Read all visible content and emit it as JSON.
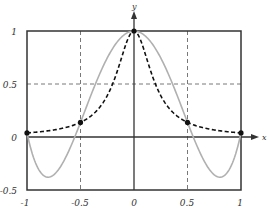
{
  "chart_data": {
    "type": "line",
    "title": "",
    "xlabel": "x",
    "ylabel": "y",
    "xlim": [
      -1,
      1
    ],
    "ylim": [
      -0.5,
      1
    ],
    "grid": true,
    "legend": null,
    "xticks": [
      "-1",
      "-0.5",
      "0",
      "0.5",
      "1"
    ],
    "yticks": [
      "-0.5",
      "0",
      "0.5",
      "1"
    ],
    "series": [
      {
        "name": "f(x) = 1/(1+25x^2)",
        "style": "dashed",
        "color": "#111111",
        "x": [
          -1,
          -0.75,
          -0.5,
          -0.25,
          0,
          0.25,
          0.5,
          0.75,
          1
        ],
        "y": [
          0.038,
          0.066,
          0.138,
          0.39,
          1,
          0.39,
          0.138,
          0.066,
          0.038
        ]
      },
      {
        "name": "interpolating polynomial (degree 4)",
        "style": "solid",
        "color": "#aaaaaa",
        "x": [
          -1,
          -0.8,
          -0.75,
          -0.5,
          -0.25,
          0,
          0.25,
          0.5,
          0.75,
          0.8,
          1
        ],
        "y": [
          0.038,
          -0.36,
          -0.35,
          0.138,
          0.73,
          1,
          0.73,
          0.138,
          -0.35,
          -0.36,
          0.038
        ]
      }
    ],
    "markers": {
      "name": "interpolation nodes",
      "x": [
        -1,
        -0.5,
        0,
        0.5,
        1
      ],
      "y": [
        0.038,
        0.138,
        1,
        0.138,
        0.038
      ]
    }
  },
  "labels": {
    "x_axis": "x",
    "y_axis": "y",
    "xtick_0": "-1",
    "xtick_1": "-0.5",
    "xtick_2": "0",
    "xtick_3": "0.5",
    "xtick_4": "1",
    "ytick_0": "-0.5",
    "ytick_1": "0",
    "ytick_2": "0.5",
    "ytick_3": "1"
  }
}
